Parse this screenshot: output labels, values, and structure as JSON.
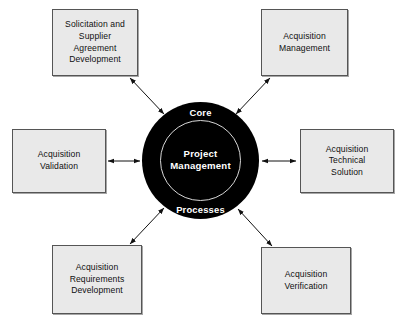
{
  "diagram": {
    "title": "Core Project Management Processes",
    "type": "hub-and-spoke",
    "background_color": "#ffffff",
    "hub": {
      "shape": "circle",
      "fill_color": "#000000",
      "text_color": "#ffffff",
      "ring_color": "#d8d8d8",
      "top_label": "Core",
      "bottom_label": "Processes",
      "center_label_line1": "Project",
      "center_label_line2": "Management"
    },
    "box_style": {
      "fill_color": "#e9e9e9",
      "border_color": "#555555",
      "text_color": "#101010"
    },
    "nodes": [
      {
        "id": "solicitation-and-supplier-agreement-development",
        "lines": [
          "Solicitation and",
          "Supplier",
          "Agreement",
          "Development"
        ],
        "position": "top-left"
      },
      {
        "id": "acquisition-management",
        "lines": [
          "Acquisition",
          "Management"
        ],
        "position": "top-right"
      },
      {
        "id": "acquisition-validation",
        "lines": [
          "Acquisition",
          "Validation"
        ],
        "position": "left"
      },
      {
        "id": "acquisition-technical-solution",
        "lines": [
          "Acquisition",
          "Technical",
          "Solution"
        ],
        "position": "right"
      },
      {
        "id": "acquisition-requirements-development",
        "lines": [
          "Acquisition",
          "Requirements",
          "Development"
        ],
        "position": "bottom-left"
      },
      {
        "id": "acquisition-verification",
        "lines": [
          "Acquisition",
          "Verification"
        ],
        "position": "bottom-right"
      }
    ],
    "connectors": [
      {
        "id": "connector-top-left",
        "from": "solicitation-and-supplier-agreement-development",
        "to": "hub",
        "style": "double-headed-arrow"
      },
      {
        "id": "connector-top-right",
        "from": "acquisition-management",
        "to": "hub",
        "style": "double-headed-arrow"
      },
      {
        "id": "connector-left",
        "from": "acquisition-validation",
        "to": "hub",
        "style": "double-headed-arrow"
      },
      {
        "id": "connector-right",
        "from": "acquisition-technical-solution",
        "to": "hub",
        "style": "double-headed-arrow"
      },
      {
        "id": "connector-bottom-left",
        "from": "acquisition-requirements-development",
        "to": "hub",
        "style": "double-headed-arrow"
      },
      {
        "id": "connector-bottom-right",
        "from": "acquisition-verification",
        "to": "hub",
        "style": "double-headed-arrow"
      }
    ]
  }
}
